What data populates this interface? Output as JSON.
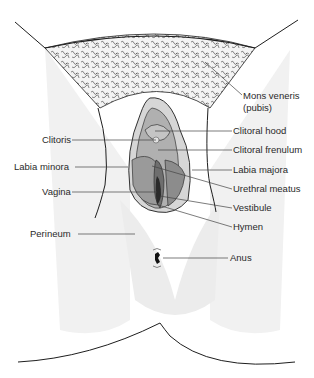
{
  "diagram": {
    "type": "anatomical illustration",
    "colors": {
      "background": "#ffffff",
      "skin_shade": "#ececec",
      "outline": "#1e1e1e",
      "labia_fill": "#9a9a9a",
      "labia_dark": "#6e6e6e",
      "vagina_dark": "#2a2a2a",
      "hair": "#333333",
      "leader_line": "#444444",
      "label_text": "#2a2a2a"
    }
  },
  "labels": {
    "mons_veneris": "Mons veneris",
    "mons_pubis": "(pubis)",
    "clitoris": "Clitoris",
    "clitoral_hood": "Clitoral hood",
    "clitoral_frenulum": "Clitoral frenulum",
    "labia_minora": "Labia minora",
    "labia_majora": "Labia majora",
    "vagina": "Vagina",
    "urethral_meatus": "Urethral meatus",
    "vestibule": "Vestibule",
    "hymen": "Hymen",
    "perineum": "Perineum",
    "anus": "Anus"
  }
}
